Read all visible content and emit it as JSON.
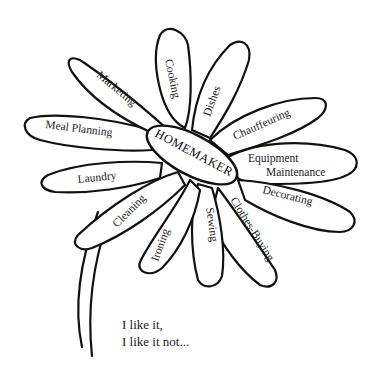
{
  "diagram": {
    "type": "daisy-illustration",
    "center_label": "HOMEMAKER",
    "petals": [
      {
        "label": "Cooking"
      },
      {
        "label": "Dishes"
      },
      {
        "label": "Chauffeuring"
      },
      {
        "label_line1": "Equipment",
        "label_line2": "Maintenance"
      },
      {
        "label": "Decorating"
      },
      {
        "label": "Clothes-Buying"
      },
      {
        "label": "Sewing"
      },
      {
        "label": "Ironing"
      },
      {
        "label": "Cleaning"
      },
      {
        "label": "Laundry"
      },
      {
        "label": "Meal Planning"
      },
      {
        "label": "Marketing"
      }
    ],
    "caption": {
      "line1": "I like it,",
      "line2": "I like it not..."
    },
    "colors": {
      "ink": "#111111",
      "background": "#ffffff"
    }
  }
}
